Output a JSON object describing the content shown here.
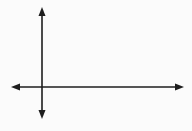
{
  "diagram": {
    "type": "coordinate-axes",
    "axes": [
      {
        "name": "x-axis",
        "orientation": "horizontal",
        "arrows": [
          "left",
          "right"
        ]
      },
      {
        "name": "y-axis",
        "orientation": "vertical",
        "arrows": [
          "up",
          "down"
        ]
      }
    ],
    "labels": [],
    "colors": {
      "line": "#1e1e1e",
      "background": "#fbfbfb"
    }
  }
}
